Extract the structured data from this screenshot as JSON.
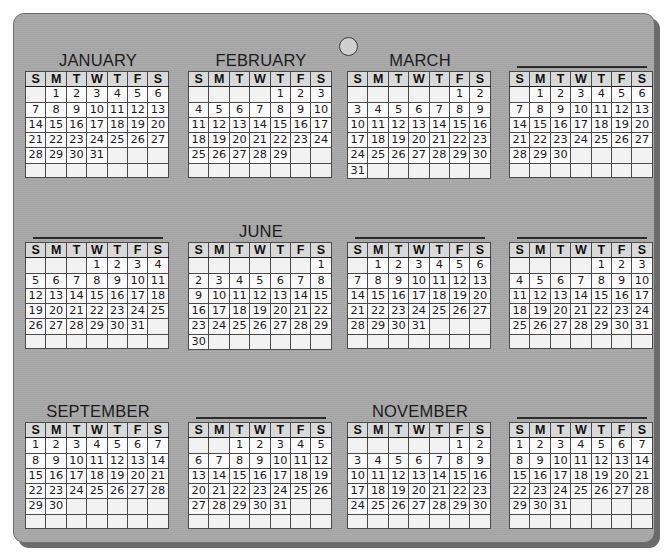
{
  "artifact": {
    "type": "wall-calendar-board",
    "year_layout": "12 months, 4 columns x 3 rows",
    "board_color": "#a8a8a8",
    "ink_color": "#1a1a1a",
    "header_fill": "#d9d9d9",
    "cell_fill": "#fbfbfb",
    "shadow_color": "#6b6b6b",
    "hang_hole": {
      "name": "hanging-hole",
      "fill": "#cfcfcf",
      "stroke": "#3a3a3a"
    }
  },
  "weekday_headers": [
    "S",
    "M",
    "T",
    "W",
    "T",
    "F",
    "S"
  ],
  "months": [
    {
      "index": 1,
      "name": "JANUARY",
      "name_visible": true,
      "start_weekday": 1,
      "days": 31,
      "weeks": [
        [
          "",
          "1",
          "2",
          "3",
          "4",
          "5",
          "6"
        ],
        [
          "7",
          "8",
          "9",
          "10",
          "11",
          "12",
          "13"
        ],
        [
          "14",
          "15",
          "16",
          "17",
          "18",
          "19",
          "20"
        ],
        [
          "21",
          "22",
          "23",
          "24",
          "25",
          "26",
          "27"
        ],
        [
          "28",
          "29",
          "30",
          "31",
          "",
          "",
          ""
        ],
        [
          "",
          "",
          "",
          "",
          "",
          "",
          ""
        ]
      ]
    },
    {
      "index": 2,
      "name": "FEBRUARY",
      "name_visible": true,
      "start_weekday": 4,
      "days": 29,
      "weeks": [
        [
          "",
          "",
          "",
          "",
          "1",
          "2",
          "3"
        ],
        [
          "4",
          "5",
          "6",
          "7",
          "8",
          "9",
          "10"
        ],
        [
          "11",
          "12",
          "13",
          "14",
          "15",
          "16",
          "17"
        ],
        [
          "18",
          "19",
          "20",
          "21",
          "22",
          "23",
          "24"
        ],
        [
          "25",
          "26",
          "27",
          "28",
          "29",
          "",
          ""
        ],
        [
          "",
          "",
          "",
          "",
          "",
          "",
          ""
        ]
      ]
    },
    {
      "index": 3,
      "name": "MARCH",
      "name_visible": true,
      "start_weekday": 5,
      "days": 31,
      "weeks": [
        [
          "",
          "",
          "",
          "",
          "",
          "1",
          "2"
        ],
        [
          "3",
          "4",
          "5",
          "6",
          "7",
          "8",
          "9"
        ],
        [
          "10",
          "11",
          "12",
          "13",
          "14",
          "15",
          "16"
        ],
        [
          "17",
          "18",
          "19",
          "20",
          "21",
          "22",
          "23"
        ],
        [
          "24",
          "25",
          "26",
          "27",
          "28",
          "29",
          "30"
        ],
        [
          "31",
          "",
          "",
          "",
          "",
          "",
          ""
        ]
      ]
    },
    {
      "index": 4,
      "name": "",
      "name_visible": false,
      "start_weekday": 1,
      "days": 30,
      "weeks": [
        [
          "",
          "1",
          "2",
          "3",
          "4",
          "5",
          "6"
        ],
        [
          "7",
          "8",
          "9",
          "10",
          "11",
          "12",
          "13"
        ],
        [
          "14",
          "15",
          "16",
          "17",
          "18",
          "19",
          "20"
        ],
        [
          "21",
          "22",
          "23",
          "24",
          "25",
          "26",
          "27"
        ],
        [
          "28",
          "29",
          "30",
          "",
          "",
          "",
          ""
        ],
        [
          "",
          "",
          "",
          "",
          "",
          "",
          ""
        ]
      ]
    },
    {
      "index": 5,
      "name": "",
      "name_visible": false,
      "start_weekday": 3,
      "days": 31,
      "weeks": [
        [
          "",
          "",
          "",
          "1",
          "2",
          "3",
          "4"
        ],
        [
          "5",
          "6",
          "7",
          "8",
          "9",
          "10",
          "11"
        ],
        [
          "12",
          "13",
          "14",
          "15",
          "16",
          "17",
          "18"
        ],
        [
          "19",
          "20",
          "21",
          "22",
          "23",
          "24",
          "25"
        ],
        [
          "26",
          "27",
          "28",
          "29",
          "30",
          "31",
          ""
        ],
        [
          "",
          "",
          "",
          "",
          "",
          "",
          ""
        ]
      ]
    },
    {
      "index": 6,
      "name": "JUNE",
      "name_visible": true,
      "start_weekday": 6,
      "days": 30,
      "weeks": [
        [
          "",
          "",
          "",
          "",
          "",
          "",
          "1"
        ],
        [
          "2",
          "3",
          "4",
          "5",
          "6",
          "7",
          "8"
        ],
        [
          "9",
          "10",
          "11",
          "12",
          "13",
          "14",
          "15"
        ],
        [
          "16",
          "17",
          "18",
          "19",
          "20",
          "21",
          "22"
        ],
        [
          "23",
          "24",
          "25",
          "26",
          "27",
          "28",
          "29"
        ],
        [
          "30",
          "",
          "",
          "",
          "",
          "",
          ""
        ]
      ]
    },
    {
      "index": 7,
      "name": "",
      "name_visible": false,
      "start_weekday": 1,
      "days": 31,
      "weeks": [
        [
          "",
          "1",
          "2",
          "3",
          "4",
          "5",
          "6"
        ],
        [
          "7",
          "8",
          "9",
          "10",
          "11",
          "12",
          "13"
        ],
        [
          "14",
          "15",
          "16",
          "17",
          "18",
          "19",
          "20"
        ],
        [
          "21",
          "22",
          "23",
          "24",
          "25",
          "26",
          "27"
        ],
        [
          "28",
          "29",
          "30",
          "31",
          "",
          "",
          ""
        ],
        [
          "",
          "",
          "",
          "",
          "",
          "",
          ""
        ]
      ]
    },
    {
      "index": 8,
      "name": "",
      "name_visible": false,
      "start_weekday": 4,
      "days": 31,
      "weeks": [
        [
          "",
          "",
          "",
          "",
          "1",
          "2",
          "3"
        ],
        [
          "4",
          "5",
          "6",
          "7",
          "8",
          "9",
          "10"
        ],
        [
          "11",
          "12",
          "13",
          "14",
          "15",
          "16",
          "17"
        ],
        [
          "18",
          "19",
          "20",
          "21",
          "22",
          "23",
          "24"
        ],
        [
          "25",
          "26",
          "27",
          "28",
          "29",
          "30",
          "31"
        ],
        [
          "",
          "",
          "",
          "",
          "",
          "",
          ""
        ]
      ]
    },
    {
      "index": 9,
      "name": "SEPTEMBER",
      "name_visible": true,
      "start_weekday": 0,
      "days": 30,
      "weeks": [
        [
          "1",
          "2",
          "3",
          "4",
          "5",
          "6",
          "7"
        ],
        [
          "8",
          "9",
          "10",
          "11",
          "12",
          "13",
          "14"
        ],
        [
          "15",
          "16",
          "17",
          "18",
          "19",
          "20",
          "21"
        ],
        [
          "22",
          "23",
          "24",
          "25",
          "26",
          "27",
          "28"
        ],
        [
          "29",
          "30",
          "",
          "",
          "",
          "",
          ""
        ],
        [
          "",
          "",
          "",
          "",
          "",
          "",
          ""
        ]
      ]
    },
    {
      "index": 10,
      "name": "",
      "name_visible": false,
      "start_weekday": 2,
      "days": 31,
      "weeks": [
        [
          "",
          "",
          "1",
          "2",
          "3",
          "4",
          "5"
        ],
        [
          "6",
          "7",
          "8",
          "9",
          "10",
          "11",
          "12"
        ],
        [
          "13",
          "14",
          "15",
          "16",
          "17",
          "18",
          "19"
        ],
        [
          "20",
          "21",
          "22",
          "23",
          "24",
          "25",
          "26"
        ],
        [
          "27",
          "28",
          "29",
          "30",
          "31",
          "",
          ""
        ],
        [
          "",
          "",
          "",
          "",
          "",
          "",
          ""
        ]
      ]
    },
    {
      "index": 11,
      "name": "NOVEMBER",
      "name_visible": true,
      "start_weekday": 5,
      "days": 30,
      "weeks": [
        [
          "",
          "",
          "",
          "",
          "",
          "1",
          "2"
        ],
        [
          "3",
          "4",
          "5",
          "6",
          "7",
          "8",
          "9"
        ],
        [
          "10",
          "11",
          "12",
          "13",
          "14",
          "15",
          "16"
        ],
        [
          "17",
          "18",
          "19",
          "20",
          "21",
          "22",
          "23"
        ],
        [
          "24",
          "25",
          "26",
          "27",
          "28",
          "29",
          "30"
        ],
        [
          "",
          "",
          "",
          "",
          "",
          "",
          ""
        ]
      ]
    },
    {
      "index": 12,
      "name": "",
      "name_visible": false,
      "start_weekday": 0,
      "days": 31,
      "weeks": [
        [
          "1",
          "2",
          "3",
          "4",
          "5",
          "6",
          "7"
        ],
        [
          "8",
          "9",
          "10",
          "11",
          "12",
          "13",
          "14"
        ],
        [
          "15",
          "16",
          "17",
          "18",
          "19",
          "20",
          "21"
        ],
        [
          "22",
          "23",
          "24",
          "25",
          "26",
          "27",
          "28"
        ],
        [
          "29",
          "30",
          "31",
          "",
          "",
          "",
          ""
        ],
        [
          "",
          "",
          "",
          "",
          "",
          "",
          ""
        ]
      ]
    }
  ]
}
